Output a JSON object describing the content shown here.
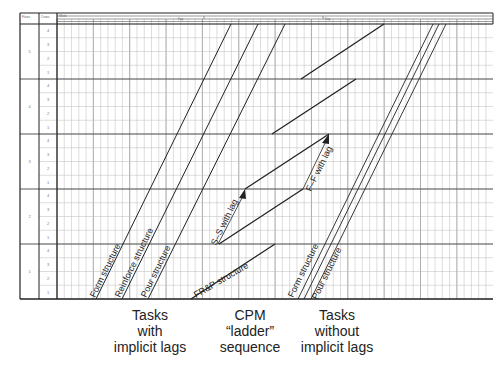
{
  "header": {
    "floor_col_label": "Floors",
    "crew_col_label": "Crews",
    "time_label": "Week",
    "period_labels": [
      "Day",
      "Day"
    ]
  },
  "grid": {
    "floors": [
      {
        "label": "5",
        "crews": [
          "4",
          "3",
          "2",
          "1"
        ]
      },
      {
        "label": "4",
        "crews": [
          "4",
          "3",
          "2",
          "1"
        ]
      },
      {
        "label": "3",
        "crews": [
          "4",
          "3",
          "2",
          "1"
        ]
      },
      {
        "label": "2",
        "crews": [
          "4",
          "3",
          "2",
          "1"
        ]
      },
      {
        "label": "1",
        "crews": [
          "4",
          "3",
          "2",
          "1"
        ]
      }
    ]
  },
  "labels": {
    "left_form": "Form structure",
    "left_reinforce": "Reinforce structure",
    "left_pour": "Pour structure",
    "frp": "FR&P structure",
    "ss_lag": "S–S with lag",
    "ff_lag": "F–F with lag",
    "right_form": "Form structure",
    "right_pour": "Pour structure"
  },
  "captions": {
    "left": [
      "Tasks",
      "with",
      "implicit lags"
    ],
    "middle": [
      "CPM",
      "“ladder”",
      "sequence"
    ],
    "right": [
      "Tasks",
      "without",
      "implicit lags"
    ]
  },
  "chart_data": {
    "type": "line",
    "xlabel": "Time",
    "ylabel": "Floor / Crew",
    "y_categories": [
      "Floor 1",
      "Floor 2",
      "Floor 3",
      "Floor 4",
      "Floor 5"
    ],
    "series": [
      {
        "name": "Form structure (implicit lags)",
        "group": "Tasks with implicit lags"
      },
      {
        "name": "Reinforce structure (implicit lags)",
        "group": "Tasks with implicit lags"
      },
      {
        "name": "Pour structure (implicit lags)",
        "group": "Tasks with implicit lags"
      },
      {
        "name": "FR&P structure",
        "group": "CPM ladder sequence"
      },
      {
        "name": "S–S with lag",
        "group": "CPM ladder sequence"
      },
      {
        "name": "F–F with lag",
        "group": "CPM ladder sequence"
      },
      {
        "name": "Form structure (no implicit lags)",
        "group": "Tasks without implicit lags"
      },
      {
        "name": "Reinforce structure (no implicit lags)",
        "group": "Tasks without implicit lags"
      },
      {
        "name": "Pour structure (no implicit lags)",
        "group": "Tasks without implicit lags"
      }
    ],
    "grid": true
  }
}
